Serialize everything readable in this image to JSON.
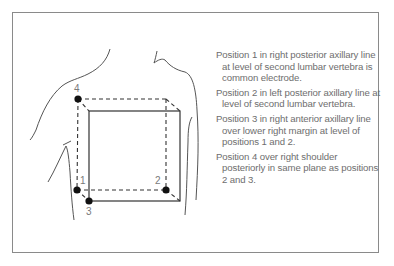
{
  "figure": {
    "point_labels": {
      "p1": "1",
      "p2": "2",
      "p3": "3",
      "p4": "4"
    },
    "colors": {
      "frame": "#8a8a8a",
      "body_outline": "#555555",
      "cube_lines": "#333333",
      "electrode_dot": "#111111",
      "text": "#6e6e6e"
    }
  },
  "legend": {
    "items": [
      {
        "label": "Position 1 in right posterior axillary line at level of second lumbar vertebra is common electrode."
      },
      {
        "label": "Position 2 in left posterior axillary line at level of second lumbar vertebra."
      },
      {
        "label": "Position 3 in right anterior axillary line over lower right margin at level of positions 1 and 2."
      },
      {
        "label": "Position 4 over right shoulder posteriorly in same plane as positions 2 and 3."
      }
    ]
  }
}
